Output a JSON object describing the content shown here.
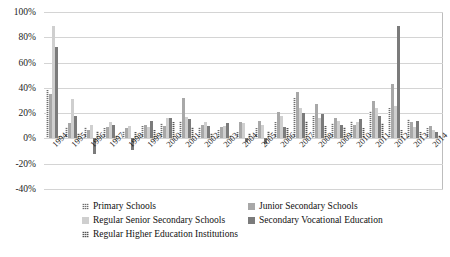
{
  "chart_data": {
    "type": "bar",
    "title": "",
    "xlabel": "",
    "ylabel": "",
    "ylim": [
      -40,
      100
    ],
    "grid": true,
    "legend_position": "bottom",
    "categories": [
      "1994",
      "1995",
      "1996",
      "1997",
      "1998",
      "1999",
      "2000",
      "2001",
      "2002",
      "2003",
      "2004",
      "2005",
      "2006",
      "2007",
      "2008",
      "2009",
      "2010",
      "2011",
      "2012",
      "2013",
      "2014"
    ],
    "ytick_labels": [
      "100%",
      "80%",
      "60%",
      "40%",
      "20%",
      "0%",
      "-20%",
      "-40%"
    ],
    "ytick_values": [
      100,
      80,
      60,
      40,
      20,
      0,
      -20,
      -40
    ],
    "series": [
      {
        "name": "Primary Schools",
        "color": "#6e6e6e",
        "pattern": "hatched",
        "values": [
          38,
          9,
          9,
          8,
          6,
          10,
          12,
          14,
          9,
          7,
          5,
          8,
          13,
          32,
          18,
          12,
          14,
          22,
          24,
          15,
          8
        ]
      },
      {
        "name": "Junior Secondary Schools",
        "color": "#a8a8a8",
        "pattern": "solid",
        "values": [
          35,
          12,
          7,
          9,
          8,
          11,
          10,
          32,
          11,
          9,
          13,
          14,
          21,
          37,
          27,
          16,
          11,
          30,
          43,
          13,
          10
        ]
      },
      {
        "name": "Regular Senior Secondary Schools",
        "color": "#cfcfcf",
        "pattern": "solid",
        "values": [
          89,
          31,
          11,
          13,
          10,
          9,
          16,
          17,
          13,
          10,
          12,
          11,
          18,
          24,
          16,
          14,
          13,
          24,
          26,
          9,
          7
        ]
      },
      {
        "name": "Secondary Vocational Education",
        "color": "#7b7b7b",
        "pattern": "solid",
        "values": [
          72,
          18,
          -12,
          11,
          -9,
          14,
          16,
          15,
          10,
          12,
          -3,
          -4,
          9,
          20,
          19,
          11,
          15,
          18,
          89,
          14,
          5
        ]
      },
      {
        "name": "Regular Higher Education Institutions",
        "color": "#555555",
        "pattern": "hatched",
        "values": [
          2,
          4,
          6,
          3,
          5,
          7,
          13,
          9,
          4,
          3,
          4,
          6,
          8,
          14,
          10,
          9,
          8,
          12,
          7,
          5,
          3
        ]
      }
    ]
  }
}
